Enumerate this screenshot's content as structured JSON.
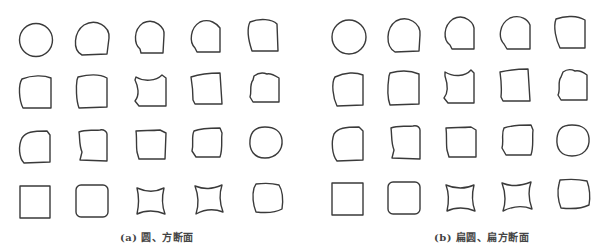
{
  "figure": {
    "panels": [
      {
        "id": "a",
        "caption": "(a) 圆、方断面",
        "rows": 4,
        "cols": 5,
        "col_centers": [
          36,
          93,
          149,
          206,
          263
        ],
        "row_centers": [
          40,
          92,
          147,
          202
        ]
      },
      {
        "id": "b",
        "caption": "(b) 扁圆、扁方断面",
        "rows": 4,
        "cols": 5,
        "col_centers": [
          349,
          405,
          459,
          514,
          571
        ],
        "row_centers": [
          37,
          89,
          144,
          199
        ]
      }
    ],
    "stroke_color": "#3a3a3a",
    "background": "#ffffff"
  }
}
